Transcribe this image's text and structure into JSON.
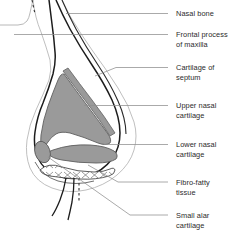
{
  "figure": {
    "type": "anatomical-diagram",
    "background_color": "#ffffff"
  },
  "colors": {
    "cartilage_fill": "#9a9a9a",
    "cartilage_stroke": "#4a4a4a",
    "outline_dark": "#1a1a1a",
    "outline_light": "#a8a8a8",
    "leader_line": "#8e8e8e",
    "text": "#2b2b2b",
    "fibro_fatty_fill": "#ffffff"
  },
  "labels": [
    {
      "id": "nasal-bone",
      "text": "Nasal bone",
      "x": 176,
      "y": 9,
      "leader": {
        "x1": 168,
        "y1": 13.5,
        "x2": 66,
        "y2": 13.5
      }
    },
    {
      "id": "frontal-process-of-maxilla",
      "text": "Frontal process\nof maxilla",
      "x": 176,
      "y": 30,
      "leader": {
        "x1": 168,
        "y1": 34.5,
        "x2": 14,
        "y2": 34.5
      }
    },
    {
      "id": "cartilage-of-septum",
      "text": "Cartilage of\nseptum",
      "x": 176,
      "y": 63,
      "leader_path": "M 168 67.5 L 116 67.5 L 95 76"
    },
    {
      "id": "upper-nasal-cartilage",
      "text": "Upper nasal\ncartilage",
      "x": 176,
      "y": 101,
      "leader": {
        "x1": 168,
        "y1": 105.5,
        "x2": 84,
        "y2": 105.5
      }
    },
    {
      "id": "lower-nasal-cartilage",
      "text": "Lower nasal\ncartilage",
      "x": 176,
      "y": 140,
      "leader": {
        "x1": 168,
        "y1": 144.5,
        "x2": 104,
        "y2": 144.5
      }
    },
    {
      "id": "fibro-fatty-tissue",
      "text": "Fibro-fatty\ntissue",
      "x": 176,
      "y": 178,
      "leader_path": "M 168 182 L 118 182 L 88 165"
    },
    {
      "id": "small-alar-cartilage",
      "text": "Small alar\ncartilage",
      "x": 176,
      "y": 211,
      "leader_path": "M 168 215 L 130 215 L 48 157"
    }
  ],
  "structures": [
    {
      "id": "nasal-dorsum-outline",
      "name": "nasal-dorsum-outline"
    },
    {
      "id": "skin-profile-outline",
      "name": "skin-profile-outline"
    },
    {
      "id": "upper-nasal-cartilage-shape",
      "name": "upper-nasal-cartilage-shape",
      "fill": "#9a9a9a"
    },
    {
      "id": "cartilage-of-septum-strip",
      "name": "cartilage-of-septum-strip",
      "fill": "#9a9a9a"
    },
    {
      "id": "lower-nasal-cartilage-shape",
      "name": "lower-nasal-cartilage-shape",
      "fill": "#9a9a9a"
    },
    {
      "id": "small-alar-cartilage-shape",
      "name": "small-alar-cartilage-shape",
      "fill": "#9a9a9a"
    },
    {
      "id": "fibro-fatty-tissue-band",
      "name": "fibro-fatty-tissue-band",
      "fill": "#ffffff",
      "hatch": "x-marks"
    },
    {
      "id": "columella-outline",
      "name": "columella-outline"
    },
    {
      "id": "dashed-midline-top",
      "name": "dashed-midline-top"
    },
    {
      "id": "dashed-midline-bottom",
      "name": "dashed-midline-bottom"
    }
  ]
}
